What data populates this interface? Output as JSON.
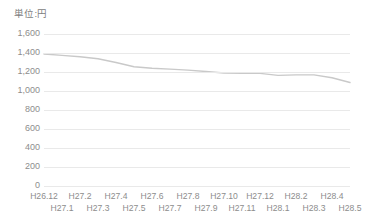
{
  "unit_caption": "単位:円",
  "axis": {
    "y_ticks": [
      "1,600",
      "1,400",
      "1,200",
      "1,000",
      "800",
      "600",
      "400",
      "200",
      "0"
    ],
    "x_ticks": [
      "H26.12",
      "H27.1",
      "H27.2",
      "H27.3",
      "H27.4",
      "H27.5",
      "H27.6",
      "H27.7",
      "H27.8",
      "H27.9",
      "H27.10",
      "H27.11",
      "H27.12",
      "H28.1",
      "H28.2",
      "H28.3",
      "H28.4",
      "H28.5"
    ]
  },
  "colors": {
    "line": "#c9c9c9",
    "gridline": "#e9e9e9",
    "text": "#8d8d8d",
    "background": "#ffffff"
  },
  "chart_data": {
    "type": "line",
    "title": "",
    "subtitle": "",
    "xlabel": "",
    "ylabel": "単位:円",
    "ylim": [
      0,
      1600
    ],
    "ytick_step": 200,
    "grid": true,
    "legend": "none",
    "categories": [
      "H26.12",
      "H27.1",
      "H27.2",
      "H27.3",
      "H27.4",
      "H27.5",
      "H27.6",
      "H27.7",
      "H27.8",
      "H27.9",
      "H27.10",
      "H27.11",
      "H27.12",
      "H28.1",
      "H28.2",
      "H28.3",
      "H28.4",
      "H28.5"
    ],
    "series": [
      {
        "name": "価格",
        "values": [
          1390,
          1375,
          1360,
          1340,
          1300,
          1255,
          1240,
          1230,
          1220,
          1205,
          1190,
          1185,
          1185,
          1165,
          1170,
          1170,
          1140,
          1090
        ]
      }
    ]
  }
}
